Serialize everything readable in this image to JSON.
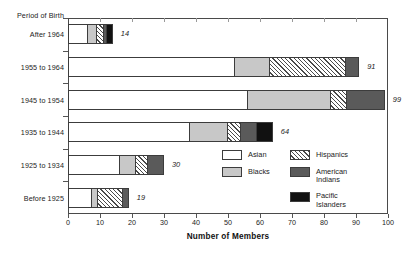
{
  "chart_data": {
    "type": "bar",
    "orientation": "horizontal",
    "stacked": true,
    "title": "",
    "xlabel": "Number of Members",
    "ylabel": "Period of Birth",
    "xlim": [
      0,
      100
    ],
    "xticks": [
      0,
      10,
      20,
      30,
      40,
      50,
      60,
      70,
      80,
      90,
      100
    ],
    "grid": false,
    "legend_position": "inside-lower-right",
    "categories": [
      "After 1964",
      "1955 to 1964",
      "1945 to 1954",
      "1935 to 1944",
      "1925 to 1934",
      "Before 1925"
    ],
    "totals": [
      14,
      91,
      99,
      64,
      30,
      19
    ],
    "series": [
      {
        "name": "Asian",
        "values": [
          6,
          52,
          56,
          38,
          16,
          7
        ]
      },
      {
        "name": "Blacks",
        "values": [
          3,
          11,
          26,
          12,
          5,
          2
        ]
      },
      {
        "name": "Hispanics",
        "values": [
          2,
          24,
          5,
          4,
          4,
          8
        ]
      },
      {
        "name": "American Indians",
        "values": [
          1,
          4,
          12,
          5,
          5,
          2
        ]
      },
      {
        "name": "Pacific Islanders",
        "values": [
          2,
          0,
          0,
          5,
          0,
          0
        ]
      }
    ],
    "colors": {
      "Asian": "#ffffff",
      "Blacks": "#c8c8c8",
      "Hispanics": "#ffffff",
      "American Indians": "#5a5a5a",
      "Pacific Islanders": "#111111",
      "axis": "#4a4a4a",
      "text": "#222222"
    }
  },
  "axes": {
    "y_title": "Period of Birth",
    "x_title": "Number of Members",
    "x_tick_labels": [
      "0",
      "10",
      "20",
      "30",
      "40",
      "50",
      "60",
      "70",
      "80",
      "90",
      "100"
    ]
  },
  "bar_value_labels": [
    "14",
    "91",
    "99",
    "64",
    "30",
    "19"
  ],
  "legend": {
    "column_left": [
      {
        "label": "Asian",
        "key": "asian"
      },
      {
        "label": "Blacks",
        "key": "blacks"
      }
    ],
    "column_right": [
      {
        "label": "Hispanics",
        "key": "hispanics"
      },
      {
        "label": "American\nIndians",
        "key": "indians"
      },
      {
        "label": "Pacific\nIslanders",
        "key": "islanders"
      }
    ]
  }
}
